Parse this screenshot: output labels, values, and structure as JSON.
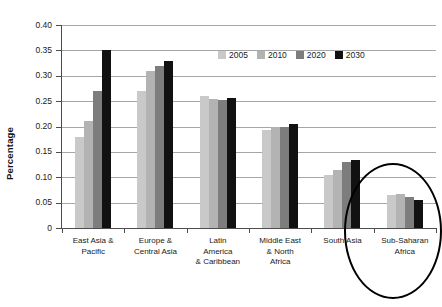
{
  "chart_data": {
    "type": "bar",
    "title": "",
    "xlabel": "",
    "ylabel": "Percentage",
    "ylim": [
      0,
      0.4
    ],
    "ytick_labels": [
      "0.40",
      "0.35",
      "0.30",
      "0.25",
      "0.20",
      "0.15",
      "0.10",
      "0.05",
      "0"
    ],
    "ytick_values": [
      0.4,
      0.35,
      0.3,
      0.25,
      0.2,
      0.15,
      0.1,
      0.05,
      0
    ],
    "grid": true,
    "legend_position": "top-center",
    "categories": [
      "East Asia & Pacific",
      "Europe & Central Asia",
      "Latin America & Caribbean",
      "Middle East & North Africa",
      "South Asia",
      "Sub-Saharan Africa"
    ],
    "category_lines": [
      [
        "East Asia &",
        "Pacific"
      ],
      [
        "Europe &",
        "Central Asia"
      ],
      [
        "Latin",
        "America",
        "& Caribbean"
      ],
      [
        "Middle East",
        "& North",
        "Africa"
      ],
      [
        "South Asia"
      ],
      [
        "Sub-Saharan",
        "Africa"
      ]
    ],
    "series": [
      {
        "name": "2005",
        "color": "#c9c9c9",
        "values": [
          0.18,
          0.27,
          0.26,
          0.193,
          0.105,
          0.065
        ]
      },
      {
        "name": "2010",
        "color": "#b3b3b3",
        "values": [
          0.21,
          0.31,
          0.255,
          0.2,
          0.115,
          0.068
        ]
      },
      {
        "name": "2020",
        "color": "#7d7d7d",
        "values": [
          0.27,
          0.32,
          0.253,
          0.2,
          0.13,
          0.062
        ]
      },
      {
        "name": "2030",
        "color": "#111111",
        "values": [
          0.35,
          0.33,
          0.257,
          0.205,
          0.135,
          0.055
        ]
      }
    ],
    "annotations": [
      {
        "name": "highlight-oval",
        "shape": "ellipse",
        "target_category": "Sub-Saharan Africa",
        "color": "#000000"
      }
    ]
  }
}
